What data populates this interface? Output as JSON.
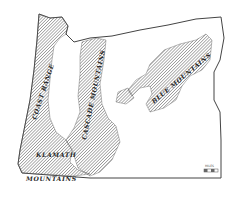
{
  "map": {
    "subject": "Oregon relief map",
    "colors": {
      "background": "#ffffff",
      "outline": "#444444",
      "hatch": "#555555"
    },
    "labels": {
      "coast_range": "COAST RANGE",
      "cascade": "CASCADE MOUNTAINS",
      "klamath": "KLAMATH",
      "klamath_mountains": "MOUNTAINS",
      "blue": "BLUE MOUNTAINS"
    },
    "scale_caption": "MILES"
  }
}
